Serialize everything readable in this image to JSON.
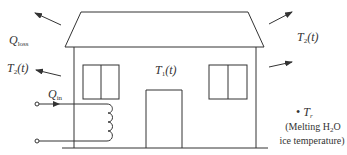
{
  "diagram": {
    "type": "heat-transfer-schematic",
    "colors": {
      "stroke": "#333333",
      "background": "#ffffff"
    },
    "labels": {
      "q_loss": {
        "main": "Q",
        "sub": "loss"
      },
      "t2_left": {
        "main": "T",
        "sub": "2",
        "arg": "(t)"
      },
      "t2_right": {
        "main": "T",
        "sub": "2",
        "arg": "(t)"
      },
      "t1": {
        "main": "T",
        "sub": "1",
        "arg": "(t)"
      },
      "q_in": {
        "main": "Q",
        "sub": "in"
      },
      "tr": {
        "bullet": "•",
        "main": "T",
        "sub": "r"
      },
      "tr_note_line1_a": "(Melting H",
      "tr_note_line1_sub": "2",
      "tr_note_line1_b": "O",
      "tr_note_line2": "ice temperature)"
    },
    "components": [
      "roof",
      "walls",
      "left-window",
      "right-window",
      "door",
      "ground-line",
      "heating-coil",
      "input-terminals",
      "heat-loss-arrows"
    ]
  }
}
